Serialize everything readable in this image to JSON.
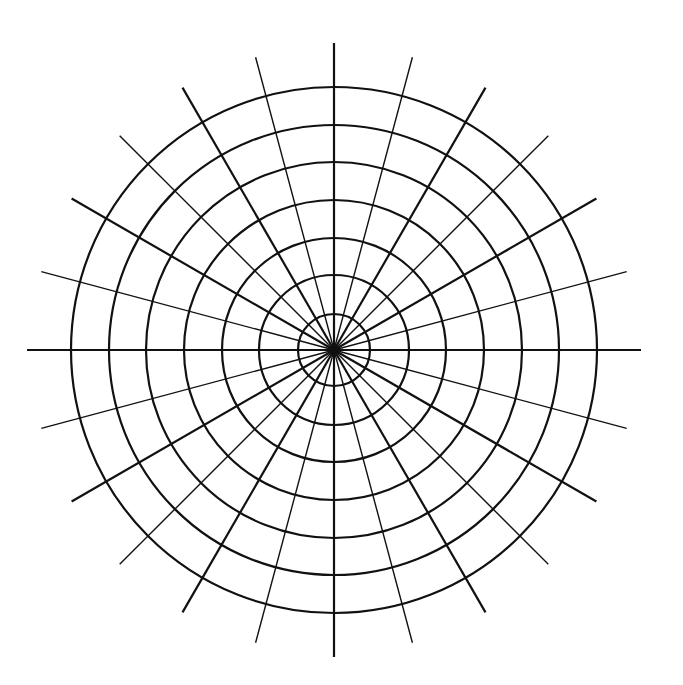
{
  "diagram": {
    "type": "polar-grid",
    "center": [
      334,
      350
    ],
    "stroke_color": "#111111",
    "background": "#ffffff",
    "rings": {
      "count": 7,
      "radii": [
        36,
        75,
        112,
        150,
        188,
        225,
        263
      ]
    },
    "spokes": {
      "count": 24,
      "angle_step_deg": 15,
      "length": 303,
      "major_every": 2,
      "major_width": 2.2,
      "minor_width": 1.4
    },
    "ring_width": 2.2
  }
}
